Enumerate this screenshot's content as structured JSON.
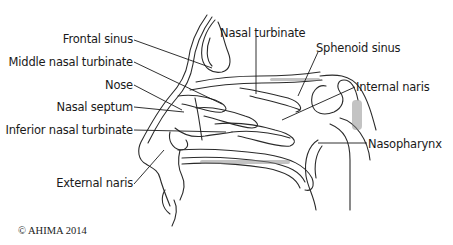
{
  "diagram": {
    "labels": {
      "frontal_sinus": "Frontal sinus",
      "middle_nasal_turbinate": "Middle nasal turbinate",
      "nose": "Nose",
      "nasal_septum": "Nasal septum",
      "inferior_nasal_turbinate": "Inferior nasal turbinate",
      "external_naris": "External naris",
      "nasal_turbinate": "Nasal turbinate",
      "sphenoid_sinus": "Sphenoid sinus",
      "internal_naris": "Internal naris",
      "nasopharynx": "Nasopharynx"
    },
    "copyright": "© AHIMA 2014"
  }
}
